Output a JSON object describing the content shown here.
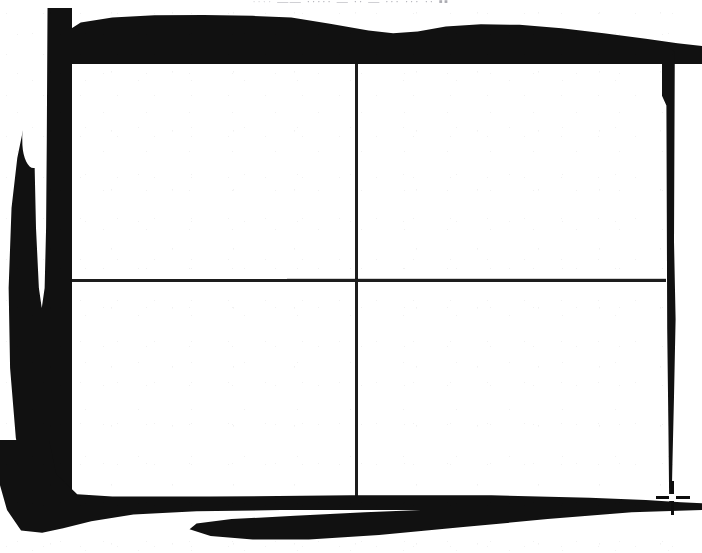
{
  "page": {
    "kind": "scanned-document",
    "width": 702,
    "height": 553,
    "background_color": "#ffffff",
    "ink_color": "#111111"
  },
  "header": {
    "clipped": true,
    "note": "Text line clipped by the top edge of the scan; only the bottom pixel row of the glyphs is visible and it is illegible.",
    "fragment_left": "····",
    "fragment_mid": "—— ·····",
    "fragment_right": "— ·· — ··· ··· ·· ▪▪"
  },
  "table": {
    "label": "empty-2x2-table",
    "rows": 2,
    "columns": 2,
    "line_color": "#1d1d1d",
    "line_width_px": 3,
    "bounds": {
      "left": 57,
      "top": 57,
      "width": 609,
      "height": 440
    },
    "column_divider_x": 355,
    "row_divider_y": 279,
    "cells": [
      {
        "name": "cell-top-left",
        "text": ""
      },
      {
        "name": "cell-top-right",
        "text": ""
      },
      {
        "name": "cell-bottom-left",
        "text": ""
      },
      {
        "name": "cell-bottom-right",
        "text": ""
      }
    ]
  },
  "artifacts": {
    "description": "Heavy black scan shadow framing the page on all four sides, typical of a photocopied book spread.",
    "top_band": "top-scan-shadow",
    "left_band": "left-scan-shadow",
    "right_band": "right-scan-shadow",
    "bottom_band": "bottom-scan-shadow",
    "left_notch": "left-shadow-teardrop-notch",
    "registration_mark": {
      "name": "registration-cross",
      "x": 672,
      "y": 497,
      "color": "#0d0d0d"
    }
  }
}
